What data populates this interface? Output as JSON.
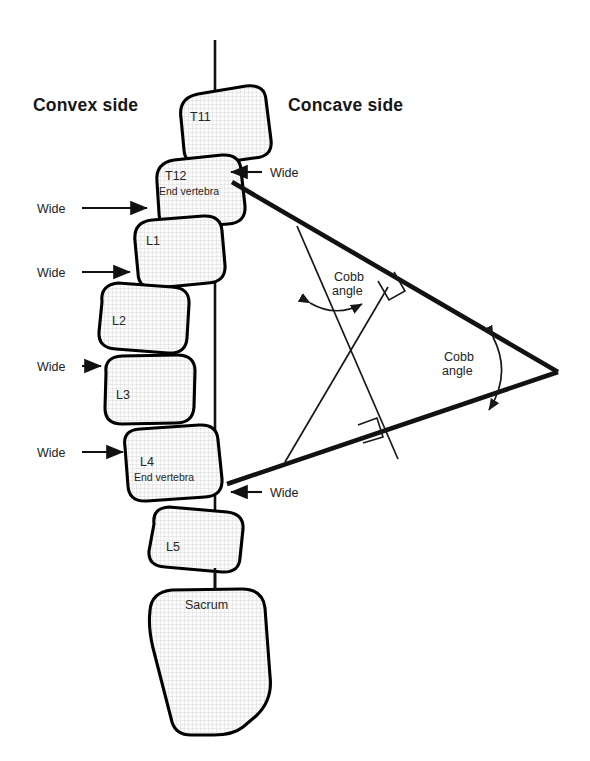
{
  "figure": {
    "background_color": "#ffffff",
    "ink_color": "#111111",
    "vertebra_fill": "#f2f2f2"
  },
  "side_labels": {
    "left": "Convex side",
    "right": "Concave side"
  },
  "vertebrae": [
    {
      "id": "t11",
      "label": "T11",
      "sublabel": ""
    },
    {
      "id": "t12",
      "label": "T12",
      "sublabel": "End vertebra"
    },
    {
      "id": "l1",
      "label": "L1",
      "sublabel": ""
    },
    {
      "id": "l2",
      "label": "L2",
      "sublabel": ""
    },
    {
      "id": "l3",
      "label": "L3",
      "sublabel": ""
    },
    {
      "id": "l4",
      "label": "L4",
      "sublabel": "End vertebra"
    },
    {
      "id": "l5",
      "label": "L5",
      "sublabel": ""
    },
    {
      "id": "sacrum",
      "label": "Sacrum",
      "sublabel": ""
    }
  ],
  "wide_markers": [
    {
      "id": "wide-right-t12",
      "label": "Wide",
      "side": "right"
    },
    {
      "id": "wide-left-t12",
      "label": "Wide",
      "side": "left"
    },
    {
      "id": "wide-left-l1",
      "label": "Wide",
      "side": "left"
    },
    {
      "id": "wide-left-l2",
      "label": "Wide",
      "side": "left"
    },
    {
      "id": "wide-left-l3",
      "label": "Wide",
      "side": "left"
    },
    {
      "id": "wide-right-l4",
      "label": "Wide",
      "side": "right"
    }
  ],
  "cobb_angles": [
    {
      "id": "cobb-perpendicular",
      "line1": "Cobb",
      "line2": "angle"
    },
    {
      "id": "cobb-apex",
      "line1": "Cobb",
      "line2": "angle"
    }
  ],
  "caption": {
    "faint_text": ""
  }
}
